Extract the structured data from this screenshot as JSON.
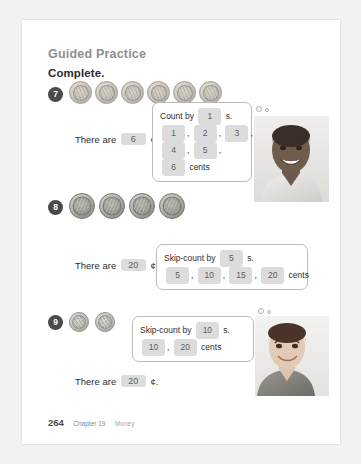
{
  "worksheet": {
    "section_title": "Guided Practice",
    "instruction": "Complete."
  },
  "problems": [
    {
      "number": "7",
      "coin_type": "penny",
      "coin_count": 6,
      "answer_prefix": "There are",
      "answer_value": "6",
      "answer_suffix": "¢.",
      "bubble": {
        "prompt_prefix": "Count by",
        "prompt_value": "1",
        "prompt_suffix": "s.",
        "counts": [
          "1",
          "2",
          "3",
          "4",
          "5"
        ],
        "total": "6",
        "total_label": "cents"
      }
    },
    {
      "number": "8",
      "coin_type": "nickel",
      "coin_count": 4,
      "answer_prefix": "There are",
      "answer_value": "20",
      "answer_suffix": "¢.",
      "bubble": {
        "prompt_prefix": "Skip-count by",
        "prompt_value": "5",
        "prompt_suffix": "s.",
        "counts": [
          "5",
          "10",
          "15"
        ],
        "total": "20",
        "total_label": "cents"
      }
    },
    {
      "number": "9",
      "coin_type": "dime",
      "coin_count": 2,
      "answer_prefix": "There are",
      "answer_value": "20",
      "answer_suffix": "¢.",
      "bubble": {
        "prompt_prefix": "Skip-count by",
        "prompt_value": "10",
        "prompt_suffix": "s.",
        "counts": [
          "10"
        ],
        "total": "20",
        "total_label": "cents"
      }
    }
  ],
  "footer": {
    "page_number": "264",
    "chapter": "Chapter 19",
    "topic": "Money"
  },
  "colors": {
    "page_background": "#ffffff",
    "canvas_background": "#f2f2f0",
    "heading_gray": "#8d8f94",
    "blank_fill": "#dcdcdc",
    "badge_fill": "#4a4a4a"
  }
}
